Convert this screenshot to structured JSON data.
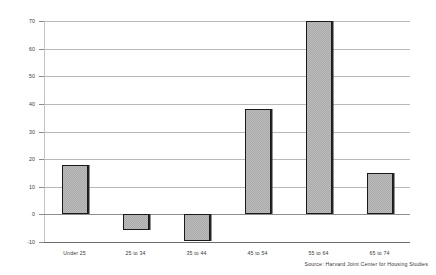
{
  "chart_data": {
    "type": "bar",
    "title": "",
    "subtitle": "",
    "xlabel": "",
    "ylabel": "",
    "categories": [
      "Under 25",
      "25 to 34",
      "35 to 44",
      "45 to 54",
      "55 to 64",
      "65 to 74"
    ],
    "values": [
      18,
      -5.5,
      -9.5,
      38,
      70,
      15
    ],
    "ylim": [
      -10,
      70
    ],
    "yticks": [
      70,
      60,
      50,
      40,
      30,
      20,
      10,
      0,
      -10
    ],
    "ytick_labels": [
      "70",
      "60",
      "50",
      "40",
      "30",
      "20",
      "10",
      "0",
      "-10"
    ],
    "grid": true,
    "legend": false,
    "legend_position": "none",
    "series": [
      {
        "name": "",
        "values": [
          18,
          -5.5,
          -9.5,
          38,
          70,
          15
        ]
      }
    ],
    "bar_fill": "#a9a9a9",
    "bar_edge": "#1a1a1a",
    "grid_color": "#b9b9b9",
    "annotations": []
  },
  "footer": {
    "source_note": "Source: Harvard Joint Center for Housing Studies"
  }
}
